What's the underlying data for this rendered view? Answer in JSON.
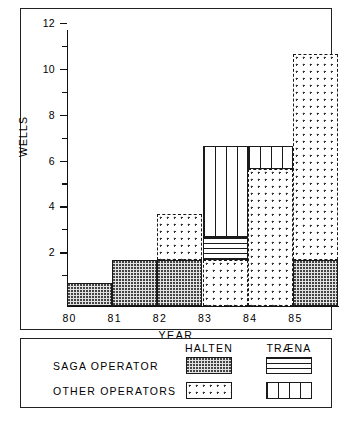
{
  "chart_data": {
    "type": "bar",
    "subtype": "stacked",
    "title": "",
    "xlabel": "YEAR",
    "ylabel": "WELLS",
    "categories": [
      "80",
      "81",
      "82",
      "83",
      "84",
      "85"
    ],
    "ylim": [
      0,
      12
    ],
    "ytick_labels": [
      "2",
      "4",
      "6",
      "8",
      "10",
      "12"
    ],
    "ytick_values": [
      2,
      4,
      6,
      8,
      10,
      12
    ],
    "yminor_values": [
      1,
      3,
      5,
      7,
      9,
      11
    ],
    "grid": false,
    "legend_position": "below-plot",
    "series": [
      {
        "name": "SAGA OPERATOR - HALTEN",
        "operator": "SAGA OPERATOR",
        "area": "HALTEN",
        "pattern": "dense-dots-grey",
        "values": [
          1,
          2,
          2,
          0,
          0,
          2
        ]
      },
      {
        "name": "SAGA OPERATOR - TRÆNA",
        "operator": "SAGA OPERATOR",
        "area": "TRÆNA",
        "pattern": "horizontal-lines",
        "values": [
          0,
          0,
          0,
          1,
          0,
          0
        ]
      },
      {
        "name": "OTHER OPERATORS - HALTEN",
        "operator": "OTHER OPERATORS",
        "area": "HALTEN",
        "pattern": "sparse-dots-dashed",
        "values": [
          0,
          0,
          2,
          2,
          6,
          9
        ]
      },
      {
        "name": "OTHER OPERATORS - TRÆNA",
        "operator": "OTHER OPERATORS",
        "area": "TRÆNA",
        "pattern": "vertical-lines",
        "values": [
          0,
          0,
          0,
          4,
          1,
          0
        ]
      }
    ],
    "totals": [
      1,
      2,
      4,
      7,
      7,
      11
    ],
    "stack_order": [
      "SAGA OPERATOR - HALTEN",
      "OTHER OPERATORS - HALTEN",
      "SAGA OPERATOR - TRÆNA",
      "OTHER OPERATORS - TRÆNA"
    ],
    "bars": [
      {
        "category": "80",
        "total": 1,
        "segments": [
          {
            "series": "SAGA OPERATOR - HALTEN",
            "from": 0,
            "to": 1
          }
        ]
      },
      {
        "category": "81",
        "total": 2,
        "segments": [
          {
            "series": "SAGA OPERATOR - HALTEN",
            "from": 0,
            "to": 2
          }
        ]
      },
      {
        "category": "82",
        "total": 4,
        "segments": [
          {
            "series": "SAGA OPERATOR - HALTEN",
            "from": 0,
            "to": 2
          },
          {
            "series": "OTHER OPERATORS - HALTEN",
            "from": 2,
            "to": 4
          }
        ]
      },
      {
        "category": "83",
        "total": 7,
        "segments": [
          {
            "series": "OTHER OPERATORS - HALTEN",
            "from": 0,
            "to": 2
          },
          {
            "series": "SAGA OPERATOR - TRÆNA",
            "from": 2,
            "to": 3
          },
          {
            "series": "OTHER OPERATORS - TRÆNA",
            "from": 3,
            "to": 7
          }
        ]
      },
      {
        "category": "84",
        "total": 7,
        "segments": [
          {
            "series": "OTHER OPERATORS - HALTEN",
            "from": 0,
            "to": 6
          },
          {
            "series": "OTHER OPERATORS - TRÆNA",
            "from": 6,
            "to": 7
          }
        ]
      },
      {
        "category": "85",
        "total": 11,
        "segments": [
          {
            "series": "SAGA OPERATOR - HALTEN",
            "from": 0,
            "to": 2
          },
          {
            "series": "OTHER OPERATORS - HALTEN",
            "from": 2,
            "to": 11
          }
        ]
      }
    ]
  },
  "legend": {
    "column_headers": [
      "HALTEN",
      "TRÆNA"
    ],
    "rows": [
      {
        "label": "SAGA OPERATOR",
        "swatches": [
          "dense-dots-grey",
          "horizontal-lines"
        ]
      },
      {
        "label": "OTHER OPERATORS",
        "swatches": [
          "sparse-dots-dashed",
          "vertical-lines"
        ]
      }
    ]
  },
  "colors": {
    "ink": "#1a1a1a",
    "paper": "#ffffff",
    "saga_halten_fill": "#e2e2e2"
  }
}
